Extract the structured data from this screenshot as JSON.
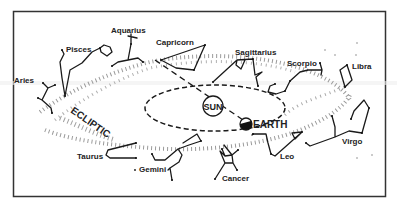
{
  "diagram": {
    "title_labels": {
      "sun": "SUN",
      "earth": "EARTH",
      "ecliptic": "ECLIPTIC"
    },
    "constellations": [
      {
        "name": "Aries"
      },
      {
        "name": "Pisces"
      },
      {
        "name": "Aquarius"
      },
      {
        "name": "Capricorn"
      },
      {
        "name": "Sagittarius"
      },
      {
        "name": "Scorpio"
      },
      {
        "name": "Libra"
      },
      {
        "name": "Virgo"
      },
      {
        "name": "Leo"
      },
      {
        "name": "Cancer"
      },
      {
        "name": "Gemini"
      },
      {
        "name": "Taurus"
      }
    ],
    "colors": {
      "frame": "#333333",
      "lines": "#1a1a1a",
      "stars_band": "#8a8a8a",
      "background": "#ffffff"
    }
  }
}
